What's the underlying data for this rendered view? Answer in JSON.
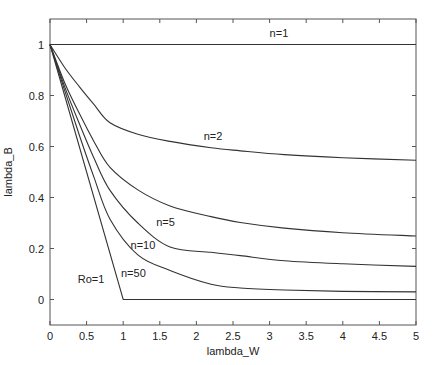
{
  "chart_data": {
    "type": "line",
    "title": "",
    "xlabel": "lambda_W",
    "ylabel": "lambda_B",
    "xlim": [
      0,
      5
    ],
    "ylim": [
      -0.1,
      1.1
    ],
    "xticks": [
      0,
      0.5,
      1,
      1.5,
      2,
      2.5,
      3,
      3.5,
      4,
      4.5,
      5
    ],
    "xtick_labels": [
      "0",
      "0.5",
      "1",
      "1.5",
      "2",
      "2.5",
      "3",
      "3.5",
      "4",
      "4.5",
      "5"
    ],
    "yticks": [
      0,
      0.2,
      0.4,
      0.6,
      0.8,
      1
    ],
    "ytick_labels": [
      "0",
      "0.2",
      "0.4",
      "0.6",
      "0.8",
      "1"
    ],
    "grid": false,
    "legend": "none",
    "series": [
      {
        "name": "n=1",
        "label": "n=1",
        "label_at": [
          3.0,
          1.03
        ],
        "x": [
          0,
          5
        ],
        "y": [
          1,
          1
        ]
      },
      {
        "name": "n=2",
        "label": "n=2",
        "label_at": [
          2.1,
          0.625
        ],
        "x": [
          0,
          0.2,
          0.4,
          0.6,
          0.82,
          1.2,
          1.64,
          2.2,
          2.6,
          3.2,
          4.0,
          5.0
        ],
        "y": [
          1,
          0.91,
          0.835,
          0.765,
          0.693,
          0.648,
          0.62,
          0.595,
          0.583,
          0.568,
          0.556,
          0.546
        ]
      },
      {
        "name": "n=5",
        "label": "n=5",
        "label_at": [
          1.45,
          0.29
        ],
        "x": [
          0,
          0.2,
          0.4,
          0.6,
          0.82,
          1.2,
          1.64,
          2.2,
          2.6,
          3.2,
          4.0,
          5.0
        ],
        "y": [
          1,
          0.85,
          0.73,
          0.62,
          0.518,
          0.43,
          0.367,
          0.325,
          0.302,
          0.28,
          0.262,
          0.249
        ]
      },
      {
        "name": "n=10",
        "label": "n=10",
        "label_at": [
          1.1,
          0.2
        ],
        "x": [
          0,
          0.2,
          0.4,
          0.6,
          0.82,
          1.2,
          1.64,
          2.2,
          2.6,
          3.2,
          4.0,
          5.0
        ],
        "y": [
          1,
          0.835,
          0.69,
          0.555,
          0.428,
          0.3,
          0.206,
          0.185,
          0.172,
          0.152,
          0.14,
          0.13
        ]
      },
      {
        "name": "n=50",
        "label": "n=50",
        "label_at": [
          0.97,
          0.09
        ],
        "x": [
          0,
          0.2,
          0.4,
          0.6,
          0.82,
          1.2,
          1.64,
          2.2,
          2.6,
          3.2,
          4.0,
          5.0
        ],
        "y": [
          1,
          0.82,
          0.645,
          0.48,
          0.315,
          0.175,
          0.114,
          0.06,
          0.045,
          0.037,
          0.032,
          0.03
        ]
      },
      {
        "name": "Ro=1",
        "label": "Ro=1",
        "label_at": [
          0.38,
          0.065
        ],
        "x": [
          0,
          1,
          5
        ],
        "y": [
          1,
          0,
          0
        ]
      }
    ]
  }
}
